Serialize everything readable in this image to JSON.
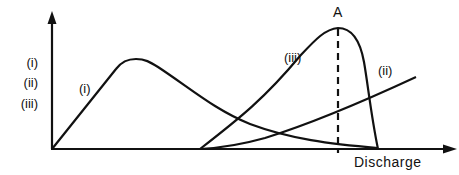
{
  "diagram": {
    "x_axis_label": "Discharge",
    "y_axis_legend": [
      "(i)",
      "(ii)",
      "(iii)"
    ],
    "curves": [
      {
        "id": "i",
        "label": "(i)",
        "description": "rises from origin to early peak then decays toward zero"
      },
      {
        "id": "ii",
        "label": "(ii)",
        "description": "rises monotonically from mid discharge"
      },
      {
        "id": "iii",
        "label": "(iii)",
        "description": "rises from mid discharge to sharp peak at A then drops steeply"
      }
    ],
    "marker": {
      "label": "A",
      "style": "dashed vertical line at peak of curve (iii)"
    },
    "colors": {
      "ink": "#111111",
      "background": "#ffffff"
    }
  }
}
